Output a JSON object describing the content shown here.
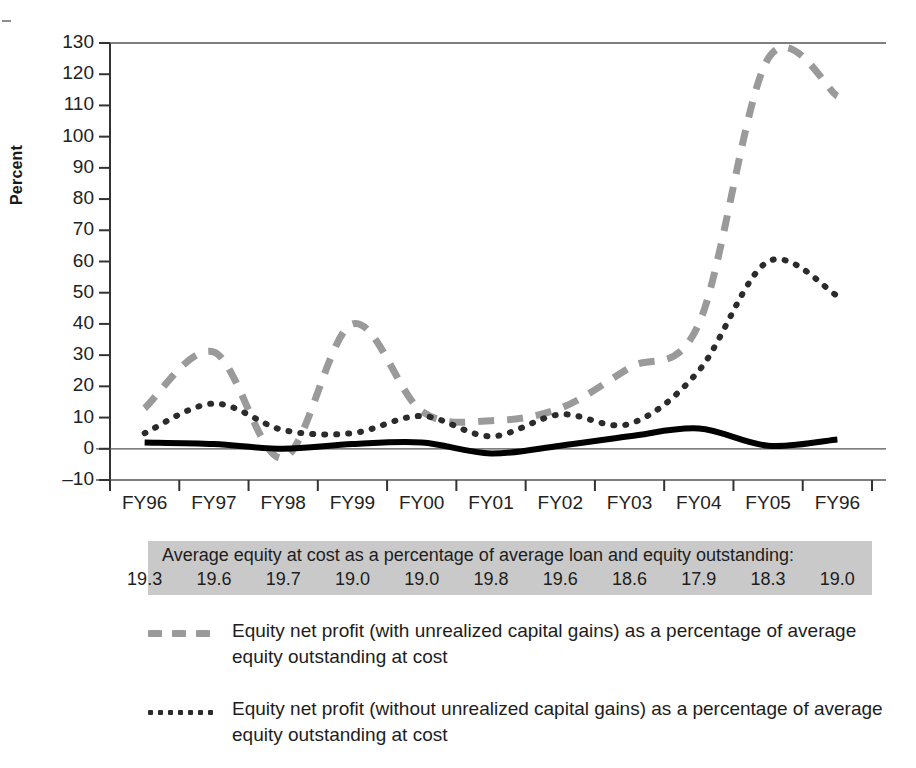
{
  "figure": {
    "y_axis_label": "Percent",
    "y_ticks": [
      "130",
      "120",
      "110",
      "100",
      "90",
      "80",
      "70",
      "60",
      "50",
      "40",
      "30",
      "20",
      "10",
      "0",
      "–10"
    ],
    "x_ticks": [
      "FY96",
      "FY97",
      "FY98",
      "FY99",
      "FY00",
      "FY01",
      "FY02",
      "FY03",
      "FY04",
      "FY05",
      "FY96"
    ]
  },
  "strip": {
    "title": "Average equity at cost as a percentage of average loan and equity outstanding:",
    "values": [
      "19.3",
      "19.6",
      "19.7",
      "19.0",
      "19.0",
      "19.8",
      "19.6",
      "18.6",
      "17.9",
      "18.3",
      "19.0"
    ]
  },
  "legend": {
    "items": [
      {
        "marker": "dashed-gray-line",
        "label": "Equity net profit (with unrealized capital gains) as a percentage of average equity outstanding at cost",
        "color": "#9a9a9a"
      },
      {
        "marker": "dotted-black-line",
        "label": "Equity net profit (without unrealized capital gains) as a percentage of average equity outstanding at cost",
        "color": "#2b2b2b"
      }
    ]
  },
  "chart_data": {
    "type": "line",
    "title": "",
    "xlabel": "",
    "ylabel": "Percent",
    "ylim": [
      -10,
      130
    ],
    "ytick_step": 10,
    "grid": false,
    "legend_position": "below",
    "categories": [
      "FY96",
      "FY97",
      "FY98",
      "FY99",
      "FY00",
      "FY01",
      "FY02",
      "FY03",
      "FY04",
      "FY05",
      "FY96"
    ],
    "series": [
      {
        "name": "Equity net profit (with unrealized capital gains) as a percentage of average equity outstanding at cost",
        "style": "dashed",
        "color": "#9a9a9a",
        "width": 7,
        "values": [
          13,
          31,
          -3,
          40,
          12,
          9,
          13,
          26,
          40,
          125,
          113
        ]
      },
      {
        "name": "Equity net profit (without unrealized capital gains) as a percentage of average equity outstanding at cost",
        "style": "dotted",
        "color": "#2b2b2b",
        "width": 6,
        "values": [
          5,
          14.5,
          6,
          5,
          10.5,
          4,
          11,
          8,
          25,
          60,
          49
        ]
      },
      {
        "name": "Total net profit as a percentage of average loan and equity outstanding",
        "style": "solid",
        "color": "#000000",
        "width": 6,
        "values": [
          2,
          1.5,
          0,
          1.5,
          2,
          -1.5,
          1,
          4,
          6.5,
          1,
          3
        ]
      }
    ],
    "annotations": {
      "strip_title": "Average equity at cost as a percentage of average loan and equity outstanding:",
      "strip_values": [
        19.3,
        19.6,
        19.7,
        19.0,
        19.0,
        19.8,
        19.6,
        18.6,
        17.9,
        18.3,
        19.0
      ]
    }
  }
}
